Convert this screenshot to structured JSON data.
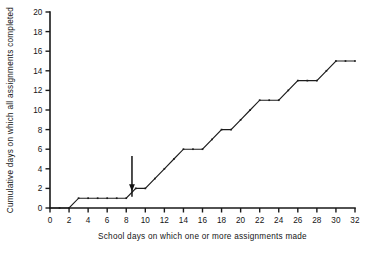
{
  "chart_data": {
    "type": "line",
    "title": "",
    "subtitle": "",
    "xlabel": "School days on which one or more assignments made",
    "ylabel": "Cumulative days on which all assignments completed",
    "xlim": [
      0,
      32
    ],
    "ylim": [
      0,
      20
    ],
    "xticks": [
      0,
      2,
      4,
      6,
      8,
      10,
      12,
      14,
      16,
      18,
      20,
      22,
      24,
      26,
      28,
      30,
      32
    ],
    "yticks": [
      0,
      2,
      4,
      6,
      8,
      10,
      12,
      14,
      16,
      18,
      20
    ],
    "xtick_labels": [
      "0",
      "2",
      "4",
      "6",
      "8",
      "10",
      "12",
      "14",
      "16",
      "18",
      "20",
      "22",
      "24",
      "26",
      "28",
      "30",
      "32"
    ],
    "ytick_labels": [
      "0",
      "2",
      "4",
      "6",
      "8",
      "10",
      "12",
      "14",
      "16",
      "18",
      "20"
    ],
    "grid": false,
    "legend": null,
    "legend_position": "none",
    "series": [
      {
        "name": "Cumulative completions",
        "x": [
          0,
          1,
          2,
          3,
          4,
          5,
          6,
          7,
          8,
          9,
          10,
          11,
          12,
          13,
          14,
          15,
          16,
          17,
          18,
          19,
          20,
          21,
          22,
          23,
          24,
          25,
          26,
          27,
          28,
          29,
          30,
          31,
          32
        ],
        "y": [
          0,
          0,
          0,
          1,
          1,
          1,
          1,
          1,
          1,
          2,
          2,
          3,
          4,
          5,
          6,
          6,
          6,
          7,
          8,
          8,
          9,
          10,
          11,
          11,
          11,
          12,
          13,
          13,
          13,
          14,
          15,
          15,
          15
        ]
      }
    ],
    "annotations": [
      {
        "type": "arrow",
        "label": "",
        "x": 8.6,
        "y_tip": 1.7,
        "y_tail": 5.3,
        "direction": "down"
      }
    ]
  }
}
